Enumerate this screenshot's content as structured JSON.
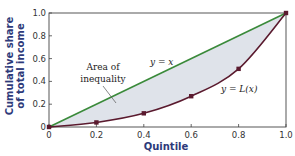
{
  "chart_data": {
    "type": "line",
    "title": "",
    "xlabel": "Quintile",
    "ylabel": "Cumulative share of total income",
    "xlim": [
      0,
      1.0
    ],
    "ylim": [
      0,
      1.0
    ],
    "x_ticks": [
      "0",
      "0.2",
      "0.4",
      "0.6",
      "0.8",
      "1.0"
    ],
    "y_ticks": [
      "0",
      "0.2",
      "0.4",
      "0.6",
      "0.8",
      "1.0"
    ],
    "grid": false,
    "series": [
      {
        "name": "y = x",
        "color": "#3a8a3a",
        "x": [
          0,
          1.0
        ],
        "y": [
          0,
          1.0
        ]
      },
      {
        "name": "y = L(x)",
        "color": "#5a1a2e",
        "x": [
          0,
          0.2,
          0.4,
          0.6,
          0.8,
          1.0
        ],
        "y": [
          0,
          0.04,
          0.12,
          0.27,
          0.51,
          1.0
        ]
      }
    ],
    "annotations": [
      {
        "text": "Area of inequality",
        "target": "shaded region between y = x and y = L(x)"
      },
      {
        "text": "y = x"
      },
      {
        "text": "y = L(x)"
      }
    ],
    "fill_color": "#dfe3ea"
  },
  "labels": {
    "xlabel": "Quintile",
    "ylabel_line1": "Cumulative share",
    "ylabel_line2": "of total income",
    "area_line1": "Area of",
    "area_line2": "inequality",
    "eq_line": "y = x",
    "lorenz": "y = L(x)"
  }
}
